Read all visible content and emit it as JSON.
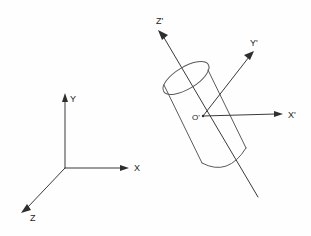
{
  "figure": {
    "background_color": "#fefefe",
    "line_color": "#3a3a3a",
    "cylinder_line_color": "#5a5a5a",
    "label_color": "#1c1c1c"
  },
  "global_frame": {
    "name": "global-coordinate-frame",
    "origin": {
      "x": 65,
      "y": 168
    },
    "axes": [
      {
        "id": "x",
        "label": "X",
        "label_x": 134,
        "label_y": 171,
        "tip_x": 128,
        "tip_y": 168
      },
      {
        "id": "y",
        "label": "Y",
        "label_x": 70,
        "label_y": 102,
        "tip_x": 65,
        "tip_y": 95
      },
      {
        "id": "z",
        "label": "Z",
        "label_x": 30,
        "label_y": 221,
        "tip_x": 22,
        "tip_y": 212
      }
    ]
  },
  "body_frame": {
    "name": "body-coordinate-frame",
    "origin": {
      "x": 203,
      "y": 116
    },
    "origin_label": "O'",
    "origin_label_x": 192,
    "origin_label_y": 120,
    "axes": [
      {
        "id": "x-prime",
        "label": "X'",
        "label_x": 288,
        "label_y": 118,
        "tip_x": 282,
        "tip_y": 114
      },
      {
        "id": "y-prime",
        "label": "Y'",
        "label_x": 250,
        "label_y": 46,
        "tip_x": 253,
        "tip_y": 52
      },
      {
        "id": "z-prime",
        "label": "Z'",
        "label_x": 156,
        "label_y": 24,
        "tip_x": 159,
        "tip_y": 31
      }
    ]
  },
  "cylinder": {
    "name": "tilted-cylinder",
    "axis_label": "Z'",
    "tilt_description": "long axis aligned with Z' axis, tilted from upper-left to lower-right"
  }
}
